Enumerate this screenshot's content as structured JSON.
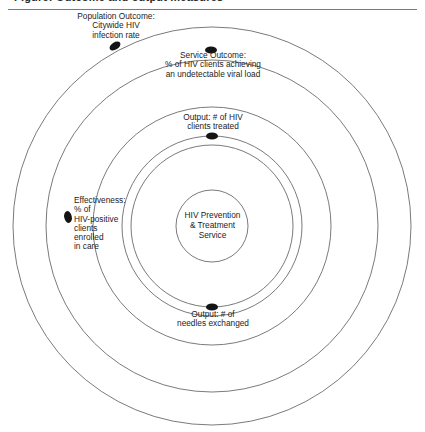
{
  "header": {
    "clipped_caption": "Figure: Outcome and output measures"
  },
  "diagram": {
    "type": "concentric-circles",
    "center": {
      "x": 212,
      "y": 226
    },
    "center_node": {
      "name": "hiv-prevention-treatment-service",
      "label": "HIV Prevention\n& Treatment\nService",
      "radius": 36
    },
    "rings": [
      {
        "name": "effectiveness-ring",
        "radius": 81,
        "marker_label": "Effectiveness:\n% of\nHIV-positive\nclients\nenrolled\nin care",
        "marker_x": 68,
        "marker_y": 217
      },
      {
        "name": "output-clients-treated-ring",
        "radius": 90,
        "marker_label": "Output: # of HIV\nclients treated",
        "marker_x": 212,
        "marker_y": 136
      },
      {
        "name": "output-needles-exchanged-ring",
        "radius": 119,
        "marker_label": "Output: # of\nneedles exchanged",
        "marker_x": 212,
        "marker_y": 307
      },
      {
        "name": "service-outcome-ring",
        "radius": 166,
        "marker_label": "Service Outcome:\n% of HIV clients achieving\nan undetectable viral load",
        "marker_x": 211,
        "marker_y": 50
      },
      {
        "name": "population-outcome-ring",
        "radius": 199,
        "marker_label": "Population Outcome:\nCitywide HIV\ninfection rate",
        "marker_x": 115,
        "marker_y": 46
      }
    ],
    "colors": {
      "ring_stroke": "#6b6b6b",
      "marker_fill": "#141414",
      "text": "#1c1c1c",
      "background": "#ffffff",
      "rule": "#7a7a7a"
    }
  }
}
